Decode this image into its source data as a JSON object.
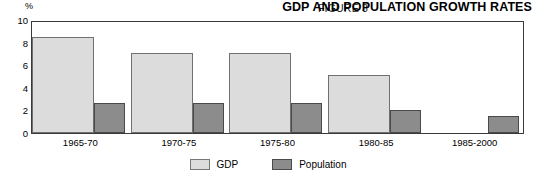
{
  "header": {
    "unit_label": "%",
    "figure_number": "FIGURE 3",
    "title": "GDP AND POPULATION GROWTH RATES"
  },
  "legend": {
    "position": "bottom-center",
    "items": [
      {
        "label": "GDP",
        "color": "#dcdcdc",
        "swatch": "gdp-swatch"
      },
      {
        "label": "Population",
        "color": "#8c8c8c",
        "swatch": "population-swatch"
      }
    ]
  },
  "colors": {
    "gdp": "#dcdcdc",
    "population": "#8c8c8c",
    "frame": "#3a3a3a",
    "background": "#ffffff",
    "text": "#000000"
  },
  "chart_data": {
    "type": "bar",
    "title": "GDP AND POPULATION GROWTH RATES",
    "subtitle": "FIGURE 3",
    "xlabel": "",
    "ylabel": "%",
    "ylim": [
      0,
      10
    ],
    "yticks": [
      0,
      2,
      4,
      6,
      8,
      10
    ],
    "ytick_labels": [
      "0",
      "2",
      "4",
      "6",
      "8",
      "10"
    ],
    "grid": false,
    "legend_position": "bottom-center",
    "categories": [
      "1965-70",
      "1970-75",
      "1975-80",
      "1980-85",
      "1985-2000"
    ],
    "series": [
      {
        "name": "GDP",
        "color": "#dcdcdc",
        "values": [
          8.5,
          7.1,
          7.1,
          5.1,
          null
        ]
      },
      {
        "name": "Population",
        "color": "#8c8c8c",
        "values": [
          2.7,
          2.7,
          2.7,
          2.0,
          1.5
        ]
      }
    ]
  }
}
